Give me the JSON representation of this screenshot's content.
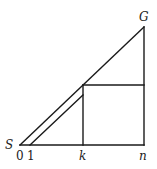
{
  "diagram": {
    "labels": {
      "start": "S",
      "goal": "G",
      "x0": "0",
      "x1": "1",
      "xk": "k",
      "xn": "n"
    },
    "points": {
      "origin": [
        20,
        145
      ],
      "one": [
        30,
        145
      ],
      "k_base": [
        83,
        145
      ],
      "n_base": [
        144,
        145
      ],
      "k_top": [
        83,
        84
      ],
      "k_inner_top": [
        83,
        94
      ],
      "n_mid": [
        144,
        84
      ],
      "goal": [
        144,
        27
      ]
    },
    "line_color": "#1a1a1a"
  }
}
